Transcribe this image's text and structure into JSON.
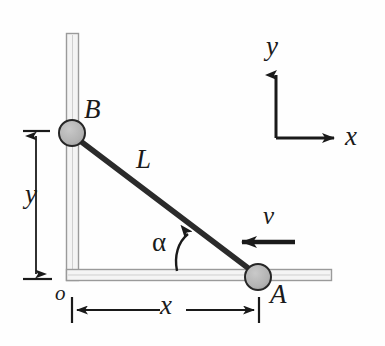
{
  "figure": {
    "kind": "mechanics-diagram",
    "background_color": "#fefefe",
    "ink_color": "#1a1a1a",
    "rail_color": "#9a9a9a",
    "rail_fill": "#f2f2f2",
    "rod_color": "#2b2b2b",
    "slider_fill": "#b3b3b3",
    "slider_stroke": "#262626"
  },
  "labels": {
    "slider_b": "B",
    "slider_a": "A",
    "rod_length": "L",
    "origin": "o",
    "dim_y": "y",
    "dim_x": "x",
    "velocity": "v",
    "angle": "α",
    "axis_y": "y",
    "axis_x": "x"
  },
  "geometry": {
    "origin": {
      "x": 73,
      "y": 276
    },
    "slider_b": {
      "cx": 72,
      "cy": 133,
      "r": 13
    },
    "slider_a": {
      "cx": 258,
      "cy": 277,
      "r": 13
    },
    "rod": {
      "x1": 80,
      "y1": 141,
      "x2": 251,
      "y2": 270
    },
    "vertical_rail": {
      "x": 66,
      "y_top": 33,
      "y_bottom": 281,
      "width": 13
    },
    "horizontal_rail": {
      "y": 270,
      "x_left": 66,
      "x_right": 332,
      "height": 11
    },
    "dim_y_line": {
      "x": 36,
      "y_top": 133,
      "y_bottom": 277
    },
    "dim_x_line": {
      "y": 310,
      "x_left": 73,
      "x_right": 258
    },
    "velocity_arrow": {
      "x_tail": 293,
      "x_head": 240,
      "y": 242
    },
    "axes_origin": {
      "x": 276,
      "y": 138
    },
    "axis_y_tip": {
      "x": 276,
      "y": 71
    },
    "axis_x_tip": {
      "x": 338,
      "y": 138
    },
    "angle_arc": {
      "vertex_x": 177,
      "vertex_y": 272,
      "tip_x": 191,
      "tip_y": 232
    }
  },
  "icons": {
    "arrow_up": "arrow-up-icon",
    "arrow_right": "arrow-right-icon",
    "arrow_left": "arrow-left-icon",
    "curved_arrow": "curved-arrow-icon"
  }
}
